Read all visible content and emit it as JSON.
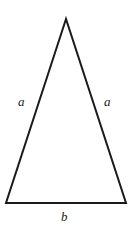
{
  "figure": {
    "kind": "geometry-diagram",
    "shape_name": "isosceles-triangle",
    "background_color": "#ffffff",
    "stroke_color": "#1a1a1a",
    "stroke_width": 2,
    "canvas": {
      "width": 131,
      "height": 238
    },
    "vertices": {
      "apex": {
        "x": 66,
        "y": 19
      },
      "bottom_left": {
        "x": 6,
        "y": 203
      },
      "bottom_right": {
        "x": 126,
        "y": 203
      }
    },
    "path": "M 66 19 L 6 203 L 126 203 Z"
  },
  "labels": {
    "left_side": "a",
    "right_side": "a",
    "base": "b"
  }
}
